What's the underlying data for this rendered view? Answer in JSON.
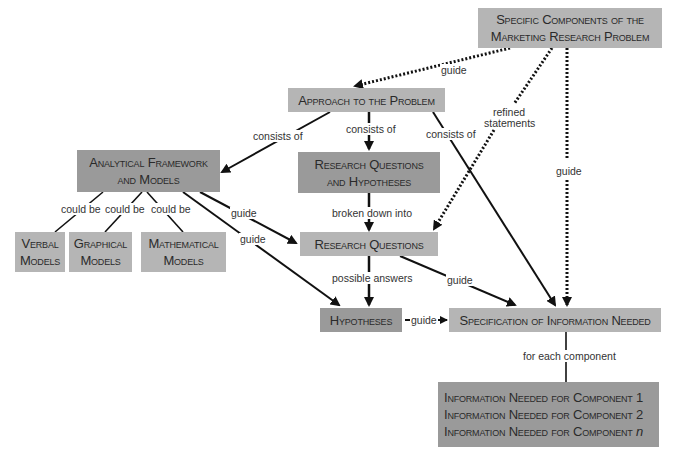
{
  "diagram": {
    "nodes": {
      "specific_components": {
        "line1": "Specific Components of the",
        "line2": "Marketing Research Problem"
      },
      "approach": {
        "label": "Approach to the Problem"
      },
      "analytical_framework": {
        "line1": "Analytical Framework",
        "line2": "and Models"
      },
      "rq_hypotheses": {
        "line1": "Research Questions",
        "line2": "and Hypotheses"
      },
      "verbal": {
        "line1": "Verbal",
        "line2": "Models"
      },
      "graphical": {
        "line1": "Graphical",
        "line2": "Models"
      },
      "mathematical": {
        "line1": "Mathematical",
        "line2": "Models"
      },
      "research_questions": {
        "label": "Research Questions"
      },
      "hypotheses": {
        "label": "Hypotheses"
      },
      "specification": {
        "label": "Specification of Information Needed"
      },
      "info_needed": {
        "rows": [
          {
            "text": "Information Needed for Component",
            "suffix": "1"
          },
          {
            "text": "Information Needed for Component",
            "suffix": "2"
          },
          {
            "text": "Information Needed for Component",
            "suffix": "n"
          }
        ]
      }
    },
    "edge_labels": {
      "guide_top": "guide",
      "refined_statements_1": "refined",
      "refined_statements_2": "statements",
      "guide_right": "guide",
      "consists_of_left": "consists of",
      "consists_of_center": "consists of",
      "consists_of_right": "consists of",
      "could_be_1": "could be",
      "could_be_2": "could be",
      "could_be_3": "could be",
      "guide_af_rq": "guide",
      "guide_af_hyp": "guide",
      "broken_down_into": "broken down into",
      "possible_answers": "possible answers",
      "guide_rq_spec": "guide",
      "guide_hyp_spec": "guide",
      "for_each_component": "for each component"
    },
    "colors": {
      "light_box": "#b5b5b5",
      "dark_box": "#9a9a9a",
      "line": "#111111",
      "background": "#ffffff"
    }
  }
}
